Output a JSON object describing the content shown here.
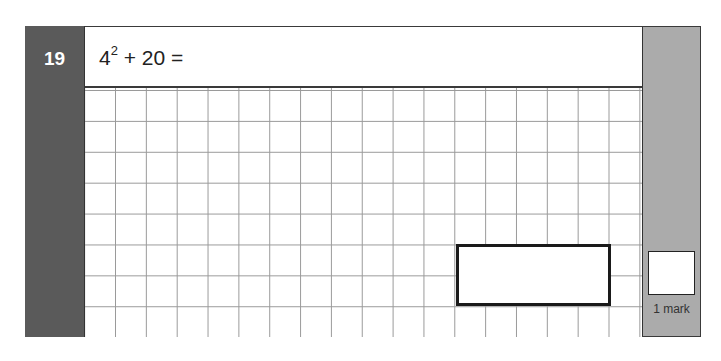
{
  "question": {
    "number": "19",
    "base": "4",
    "exponent": "2",
    "rest": " + 20 ="
  },
  "answer_box": {
    "value": ""
  },
  "marks": {
    "label": "1 mark",
    "value": ""
  },
  "colors": {
    "number_panel": "#5a5a5a",
    "marks_panel": "#ababab",
    "grid_lines": "#9a9a9a"
  }
}
